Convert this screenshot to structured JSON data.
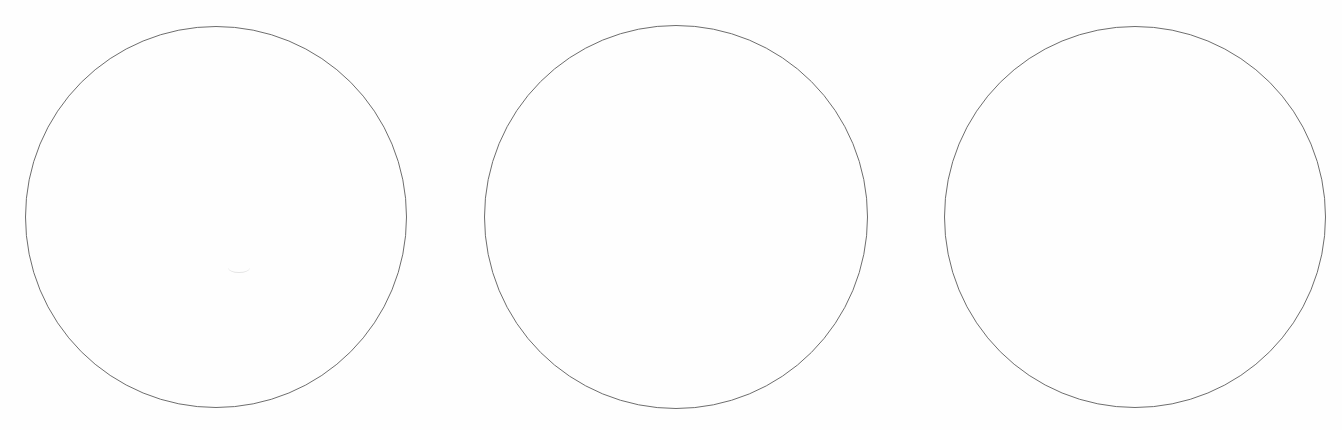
{
  "diagram": {
    "background_color": "#ffffff",
    "stroke_color": "#6e6e6e",
    "circles": [
      {
        "label": "",
        "cx": 216,
        "cy": 217,
        "r": 191
      },
      {
        "label": "",
        "cx": 676,
        "cy": 217,
        "r": 192
      },
      {
        "label": "",
        "cx": 1135,
        "cy": 217,
        "r": 191
      }
    ]
  }
}
